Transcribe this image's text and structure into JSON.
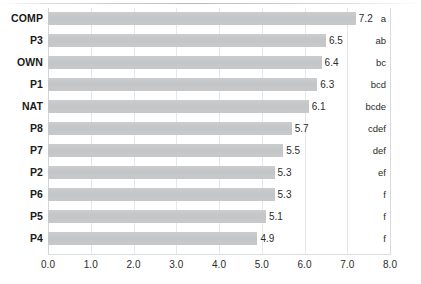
{
  "chart_data": {
    "type": "bar",
    "orientation": "horizontal",
    "title": "",
    "xlabel": "",
    "ylabel": "",
    "xlim": [
      0.0,
      8.0
    ],
    "xticks": [
      "0.0",
      "1.0",
      "2.0",
      "3.0",
      "4.0",
      "5.0",
      "6.0",
      "7.0",
      "8.0"
    ],
    "grid": "vertical",
    "legend": "none",
    "bar_color": "#c6c7c8",
    "categories": [
      "COMP",
      "P3",
      "OWN",
      "P1",
      "NAT",
      "P8",
      "P7",
      "P2",
      "P6",
      "P5",
      "P4"
    ],
    "values": [
      7.2,
      6.5,
      6.4,
      6.3,
      6.1,
      5.7,
      5.5,
      5.3,
      5.3,
      5.1,
      4.9
    ],
    "value_labels": [
      "7.2",
      "6.5",
      "6.4",
      "6.3",
      "6.1",
      "5.7",
      "5.5",
      "5.3",
      "5.3",
      "5.1",
      "4.9"
    ],
    "group_labels": [
      "a",
      "ab",
      "bc",
      "bcd",
      "bcde",
      "cdef",
      "def",
      "ef",
      "f",
      "f",
      "f"
    ],
    "rows": [
      {
        "category": "COMP",
        "value": 7.2,
        "value_label": "7.2",
        "group": "a"
      },
      {
        "category": "P3",
        "value": 6.5,
        "value_label": "6.5",
        "group": "ab"
      },
      {
        "category": "OWN",
        "value": 6.4,
        "value_label": "6.4",
        "group": "bc"
      },
      {
        "category": "P1",
        "value": 6.3,
        "value_label": "6.3",
        "group": "bcd"
      },
      {
        "category": "NAT",
        "value": 6.1,
        "value_label": "6.1",
        "group": "bcde"
      },
      {
        "category": "P8",
        "value": 5.7,
        "value_label": "5.7",
        "group": "cdef"
      },
      {
        "category": "P7",
        "value": 5.5,
        "value_label": "5.5",
        "group": "def"
      },
      {
        "category": "P2",
        "value": 5.3,
        "value_label": "5.3",
        "group": "ef"
      },
      {
        "category": "P6",
        "value": 5.3,
        "value_label": "5.3",
        "group": "f"
      },
      {
        "category": "P5",
        "value": 5.1,
        "value_label": "5.1",
        "group": "f"
      },
      {
        "category": "P4",
        "value": 4.9,
        "value_label": "4.9",
        "group": "f"
      }
    ]
  }
}
